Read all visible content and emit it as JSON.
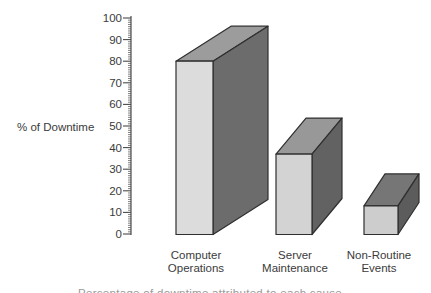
{
  "chart_data": {
    "type": "bar",
    "style": "3d-block-bars",
    "title": "",
    "ylabel": "% of Downtime",
    "xlabel": "",
    "categories": [
      "Computer Operations",
      "Server Maintenance",
      "Non-Routine Events"
    ],
    "values": [
      80,
      37,
      13
    ],
    "ylim": [
      0,
      100
    ],
    "yticks": [
      0,
      10,
      20,
      30,
      40,
      50,
      60,
      70,
      80,
      90,
      100
    ],
    "minor_tick_step": 1,
    "grid": false,
    "legend": "none",
    "series": [
      {
        "id": "computer-operations",
        "label_lines": [
          "Computer",
          "Operations"
        ],
        "value": 80,
        "faces": {
          "front": "#dcdcdc",
          "top": "#9c9c9c",
          "side": "#6c6c6c"
        }
      },
      {
        "id": "server-maintenance",
        "label_lines": [
          "Server",
          "Maintenance"
        ],
        "value": 37,
        "faces": {
          "front": "#d3d3d3",
          "top": "#989898",
          "side": "#626262"
        }
      },
      {
        "id": "non-routine-events",
        "label_lines": [
          "Non-Routine",
          "Events"
        ],
        "value": 13,
        "faces": {
          "front": "#cdcdcd",
          "top": "#767676",
          "side": "#5c5c5c"
        }
      }
    ]
  },
  "colors": {
    "background": "#ffffff",
    "axis": "#4a4a4a",
    "text": "#3b3b3b",
    "bar_outline": "#2f2f2f"
  },
  "caption_fragment": "Percentage of downtime attributed to each cause"
}
